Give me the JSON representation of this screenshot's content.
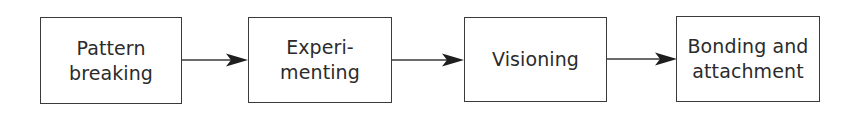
{
  "diagram": {
    "type": "linear-flow",
    "direction": "left-to-right",
    "nodes": [
      {
        "id": "pattern-breaking",
        "lines": [
          "Pattern",
          "breaking"
        ]
      },
      {
        "id": "experimenting",
        "lines": [
          "Experi-",
          "menting"
        ]
      },
      {
        "id": "visioning",
        "lines": [
          "Visioning"
        ]
      },
      {
        "id": "bonding-and-attachment",
        "lines": [
          "Bonding and",
          "attachment"
        ]
      }
    ],
    "edges": [
      {
        "from": "pattern-breaking",
        "to": "experimenting"
      },
      {
        "from": "experimenting",
        "to": "visioning"
      },
      {
        "from": "visioning",
        "to": "bonding-and-attachment"
      }
    ],
    "colors": {
      "stroke": "#3a3a3a",
      "text": "#2b2b2b",
      "background": "#ffffff"
    }
  }
}
